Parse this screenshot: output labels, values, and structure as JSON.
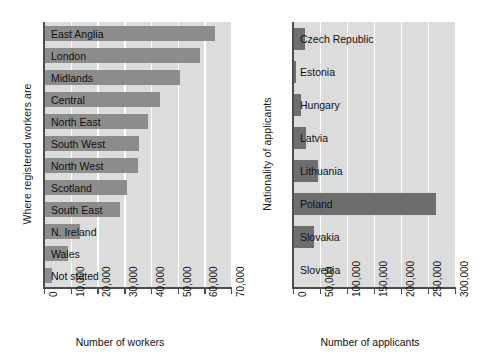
{
  "chart_data": [
    {
      "type": "bar",
      "orientation": "horizontal",
      "title": "",
      "xlabel": "Number of workers",
      "ylabel": "Where registered workers are",
      "xlim": [
        0,
        70000
      ],
      "xticks": [
        "0",
        "10,000",
        "20,000",
        "30,000",
        "40,000",
        "50,000",
        "60,000",
        "70,000"
      ],
      "xtick_values": [
        0,
        10000,
        20000,
        30000,
        40000,
        50000,
        60000,
        70000
      ],
      "grid": "vertical",
      "legend": "none",
      "bar_color": "#8c8c8c",
      "plot_background": "#dcdcdc",
      "categories": [
        "East Anglia",
        "London",
        "Midlands",
        "Central",
        "North East",
        "South West",
        "North West",
        "Scotland",
        "South East",
        "N. Ireland",
        "Wales",
        "Not stated"
      ],
      "values": [
        64000,
        58500,
        51000,
        43500,
        39000,
        35500,
        35000,
        31000,
        28500,
        13500,
        9000,
        3000
      ]
    },
    {
      "type": "bar",
      "orientation": "horizontal",
      "title": "",
      "xlabel": "Number of applicants",
      "ylabel": "Nationality of applicants",
      "xlim": [
        0,
        300000
      ],
      "xticks": [
        "0",
        "50,000",
        "100,000",
        "150,000",
        "200,000",
        "250,000",
        "300,000"
      ],
      "xtick_values": [
        0,
        50000,
        100000,
        150000,
        200000,
        250000,
        300000
      ],
      "grid": "vertical",
      "legend": "none",
      "bar_color": "#6e6e6e",
      "plot_background": "#dcdcdc",
      "categories": [
        "Czech Republic",
        "Estonia",
        "Hungary",
        "Latvia",
        "Lithuania",
        "Poland",
        "Slovakia",
        "Slovenia"
      ],
      "values": [
        23000,
        5000,
        15000,
        24000,
        46000,
        265000,
        38000,
        2000
      ]
    }
  ]
}
